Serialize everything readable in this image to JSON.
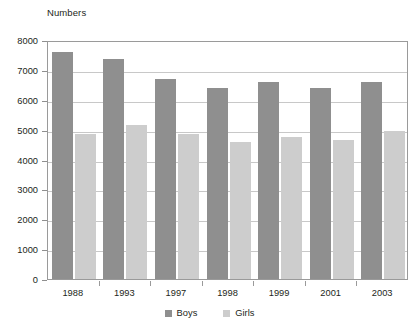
{
  "chart_data": {
    "type": "bar",
    "title": "Numbers",
    "xlabel": "",
    "ylabel": "Numbers",
    "categories": [
      "1988",
      "1993",
      "1997",
      "1998",
      "1999",
      "2001",
      "2003"
    ],
    "series": [
      {
        "name": "Boys",
        "color": "#8f8f8f",
        "values": [
          7600,
          7350,
          6700,
          6400,
          6600,
          6400,
          6600
        ]
      },
      {
        "name": "Girls",
        "color": "#cdcdcd",
        "values": [
          4850,
          5150,
          4850,
          4600,
          4750,
          4650,
          4950
        ]
      }
    ],
    "ylim": [
      0,
      8000
    ],
    "ytick_values": [
      0,
      1000,
      2000,
      3000,
      4000,
      5000,
      6000,
      7000,
      8000
    ],
    "ytick_labels": [
      "0",
      "1000",
      "2000",
      "3000",
      "4000",
      "5000",
      "6000",
      "7000",
      "8000"
    ],
    "grid": true,
    "legend_position": "bottom-center",
    "legend_entries": [
      "Boys",
      "Girls"
    ],
    "annotations": []
  },
  "axis_title": "Numbers",
  "colors": {
    "boys": "#8f8f8f",
    "girls": "#cdcdcd",
    "grid": "#c8c8c8",
    "frame": "#9a9a9a",
    "text": "#231f20",
    "background": "#ffffff"
  }
}
